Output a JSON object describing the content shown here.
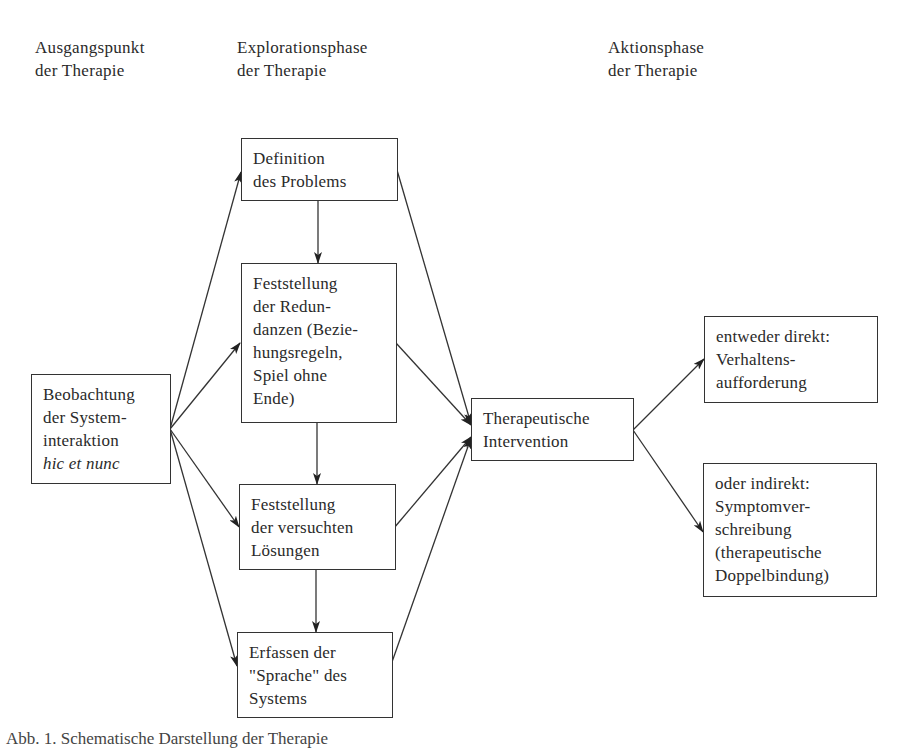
{
  "headings": {
    "start": [
      "Ausgangspunkt",
      "der Therapie"
    ],
    "exploration": [
      "Explorationsphase",
      "der Therapie"
    ],
    "action": [
      "Aktionsphase",
      "der Therapie"
    ]
  },
  "nodes": {
    "observation": [
      "Beobachtung",
      "der System-",
      "interaktion",
      "hic et nunc"
    ],
    "definition": [
      "Definition",
      "des Problems"
    ],
    "redundancies": [
      "Feststellung",
      "der Redun-",
      "danzen (Bezie-",
      "hungsregeln,",
      "Spiel ohne",
      "Ende)"
    ],
    "attempted_solutions": [
      "Feststellung",
      "der versuchten",
      "Lösungen"
    ],
    "language": [
      "Erfassen der",
      "\"Sprache\" des",
      "Systems"
    ],
    "intervention": [
      "Therapeutische",
      "Intervention"
    ],
    "direct": [
      "entweder direkt:",
      "Verhaltens-",
      "aufforderung"
    ],
    "indirect": [
      "oder indirekt:",
      "Symptomver-",
      "schreibung",
      "(therapeutische",
      "Doppelbindung)"
    ]
  },
  "edges": [
    {
      "from": "observation",
      "to": "definition"
    },
    {
      "from": "observation",
      "to": "redundancies"
    },
    {
      "from": "observation",
      "to": "attempted_solutions"
    },
    {
      "from": "observation",
      "to": "language"
    },
    {
      "from": "definition",
      "to": "redundancies"
    },
    {
      "from": "redundancies",
      "to": "attempted_solutions"
    },
    {
      "from": "attempted_solutions",
      "to": "language"
    },
    {
      "from": "definition",
      "to": "intervention"
    },
    {
      "from": "redundancies",
      "to": "intervention"
    },
    {
      "from": "attempted_solutions",
      "to": "intervention"
    },
    {
      "from": "language",
      "to": "intervention"
    },
    {
      "from": "intervention",
      "to": "direct"
    },
    {
      "from": "intervention",
      "to": "indirect"
    }
  ],
  "caption": "Abb. 1. Schematische Darstellung der Therapie"
}
